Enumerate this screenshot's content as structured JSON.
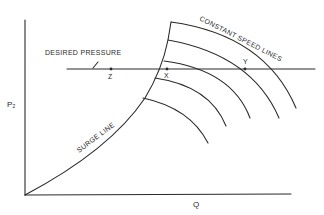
{
  "diagram": {
    "type": "compressor performance map",
    "axes": {
      "y_label": "P₂",
      "x_label": "Q"
    },
    "labels": {
      "desired_pressure": "DESIRED PRESSURE",
      "constant_speed_lines": "CONSTANT SPEED LINES",
      "surge_line": "SURGE LINE"
    },
    "points": [
      {
        "name": "Z",
        "label": "Z"
      },
      {
        "name": "X",
        "label": "X"
      },
      {
        "name": "Y",
        "label": "Y"
      }
    ],
    "constant_speed_line_count": 5,
    "colors": {
      "ink": "#2a2a2a",
      "background": "#ffffff"
    }
  }
}
